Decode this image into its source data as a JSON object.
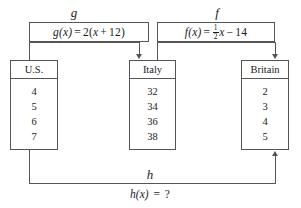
{
  "functions": {
    "g": {
      "name": "g",
      "formula_text": "g(x) = 2(x + 12)",
      "lhs": "g(x)",
      "equals": "=",
      "coefficient": "2(",
      "variable": "x",
      "plus": "+",
      "constant": "12)"
    },
    "f": {
      "name": "f",
      "formula_text": "f(x) = 1/2 x - 14",
      "lhs": "f(x)",
      "equals": "=",
      "frac_numerator": "1",
      "frac_denominator": "2",
      "variable": "x",
      "minus": "−",
      "constant": "14"
    },
    "h": {
      "name": "h",
      "formula_text": "h(x) = ?",
      "lhs": "h(x)",
      "equals": "=",
      "value": "?"
    }
  },
  "boxes": [
    {
      "id": "us",
      "header": "U.S.",
      "values": [
        "4",
        "5",
        "6",
        "7"
      ]
    },
    {
      "id": "italy",
      "header": "Italy",
      "values": [
        "32",
        "34",
        "36",
        "38"
      ]
    },
    {
      "id": "britain",
      "header": "Britain",
      "values": [
        "2",
        "3",
        "4",
        "5"
      ]
    }
  ],
  "colors": {
    "stroke": "#555555",
    "text": "#1a1a1a",
    "background": "#ffffff"
  }
}
